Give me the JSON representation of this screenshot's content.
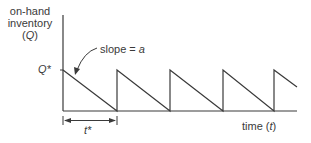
{
  "diagram": {
    "y_axis_label": {
      "line1": "on-hand",
      "line2": "inventory",
      "line3_open": "(",
      "line3_var": "Q",
      "line3_close": ")"
    },
    "x_axis_label": {
      "text": "time (",
      "var": "t",
      "close": ")"
    },
    "peak_label": "Q*",
    "slope_annotation": {
      "text": "slope = ",
      "var": "a"
    },
    "cycle_label": "t*",
    "colors": {
      "line": "#3a3a3a",
      "background": "#ffffff"
    },
    "cycles": 4
  }
}
